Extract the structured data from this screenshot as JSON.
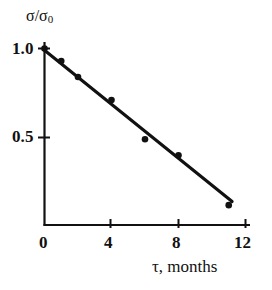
{
  "chart_data": {
    "type": "scatter",
    "title": "",
    "subtitle": "",
    "xlabel": "τ, months",
    "ylabel": "σ/σ",
    "ylabel_sub": "0",
    "xlim": [
      0,
      12
    ],
    "ylim": [
      0,
      1.06
    ],
    "xticks": [
      0,
      4,
      8,
      12
    ],
    "xtick_labels": [
      "0",
      "4",
      "8",
      "12"
    ],
    "yticks": [
      0.5,
      1.0
    ],
    "ytick_labels": [
      "0.5",
      "1.0"
    ],
    "grid": false,
    "legend": "none",
    "axis_style": "left-and-bottom-spines",
    "marker": "filled-circle",
    "marker_color": "#111111",
    "line_color": "#111111",
    "axis_color": "#111111",
    "background_color": "#ffffff",
    "x": [
      0,
      1,
      2,
      4,
      6,
      8,
      11
    ],
    "y": [
      1.0,
      0.93,
      0.84,
      0.71,
      0.49,
      0.4,
      0.12
    ],
    "points": [
      {
        "x": 0,
        "y": 1.0
      },
      {
        "x": 1,
        "y": 0.93
      },
      {
        "x": 2,
        "y": 0.84
      },
      {
        "x": 4,
        "y": 0.71
      },
      {
        "x": 6,
        "y": 0.49
      },
      {
        "x": 8,
        "y": 0.4
      },
      {
        "x": 11,
        "y": 0.12
      }
    ],
    "series": [
      {
        "name": "measured data",
        "type": "scatter",
        "x": [
          0,
          1,
          2,
          4,
          6,
          8,
          11
        ],
        "values": [
          1.0,
          0.93,
          0.84,
          0.71,
          0.49,
          0.4,
          0.12
        ]
      },
      {
        "name": "linear fit",
        "type": "line",
        "x": [
          0,
          11.2
        ],
        "values": [
          0.99,
          0.14
        ]
      }
    ],
    "fit_line": {
      "x_start": 0,
      "y_start": 0.99,
      "x_end": 11.2,
      "y_end": 0.14
    }
  }
}
